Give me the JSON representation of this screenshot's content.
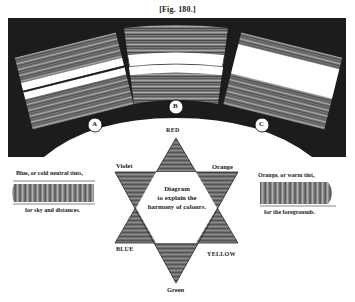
{
  "figure": {
    "title": "[Fig. 180.]"
  },
  "arch": {
    "background_color": "#1c1c1c",
    "swatches": [
      {
        "id": "A",
        "label": "A"
      },
      {
        "id": "B",
        "label": "B"
      },
      {
        "id": "C",
        "label": "C"
      }
    ]
  },
  "star": {
    "vertices": {
      "top": "RED",
      "upper_left": "Violet",
      "upper_right": "Orange",
      "lower_left": "BLUE",
      "lower_right": "YELLOW",
      "bottom": "Green"
    },
    "center_text": [
      "Diagram",
      "to explain the",
      "harmony of colours."
    ]
  },
  "left_sample": {
    "caption_top": "Blue, or cold neutral tints,",
    "caption_bottom": "for sky and distances."
  },
  "right_sample": {
    "caption_top": "Orange, or warm tint,",
    "caption_bottom": "for the foregrounds."
  }
}
